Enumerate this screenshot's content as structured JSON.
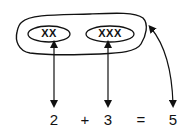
{
  "diagram": {
    "group": {
      "left_set": {
        "label": "XX"
      },
      "right_set": {
        "label": "XXX"
      }
    },
    "equation": {
      "a": "2",
      "plus": "+",
      "b": "3",
      "equals": "=",
      "result": "5"
    },
    "colors": {
      "ink": "#111111",
      "background": "#ffffff"
    }
  }
}
